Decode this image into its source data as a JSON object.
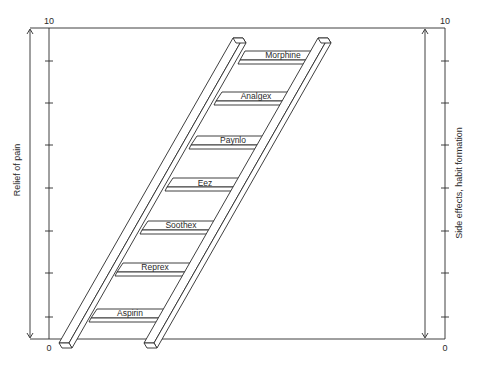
{
  "diagram": {
    "type": "ladder",
    "left_axis": {
      "title": "Relief of pain",
      "top_label": "10",
      "bottom_label": "0"
    },
    "right_axis": {
      "title": "Side effects, habit formation",
      "top_label": "10",
      "bottom_label": "0"
    },
    "rungs": [
      {
        "label": "Morphine"
      },
      {
        "label": "Analgex"
      },
      {
        "label": "Paynlo"
      },
      {
        "label": "Eez"
      },
      {
        "label": "Soothex"
      },
      {
        "label": "Reprex"
      },
      {
        "label": "Aspirin"
      }
    ],
    "colors": {
      "ink": "#2a2a2a",
      "background": "#ffffff"
    }
  }
}
